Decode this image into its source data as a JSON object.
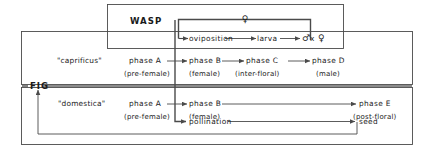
{
  "diagram": {
    "title_wasp": "WASP",
    "title_fig": "FIG",
    "wasp_cycle": {
      "female_top": "♀",
      "oviposition": "oviposition",
      "larva": "larva",
      "mating_male": "♂",
      "mating_x": "x",
      "mating_female": "♀"
    },
    "caprificus": {
      "name": "\"caprificus\"",
      "phases": [
        {
          "label": "phase A",
          "sub": "(pre-female)"
        },
        {
          "label": "phase B",
          "sub": "(female)"
        },
        {
          "label": "phase C",
          "sub": "(inter-floral)"
        },
        {
          "label": "phase D",
          "sub": "(male)"
        }
      ]
    },
    "domestica": {
      "name": "\"domestica\"",
      "phases": [
        {
          "label": "phase A",
          "sub": "(pre-female)"
        },
        {
          "label": "phase B",
          "sub": "(female)"
        },
        {
          "label": "phase E",
          "sub": "(post-floral)"
        }
      ],
      "pollination": "pollination",
      "seed": "seed"
    },
    "colors": {
      "line": "#4a4a4a",
      "text": "#1a1a1a",
      "background": "#ffffff"
    }
  }
}
